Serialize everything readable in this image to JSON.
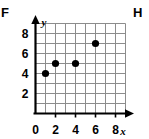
{
  "choices": {
    "left_label": "F",
    "right_label": "H"
  },
  "chart_data": {
    "type": "scatter",
    "title": "",
    "xlabel": "x",
    "ylabel": "y",
    "points": [
      {
        "x": 1,
        "y": 4
      },
      {
        "x": 2,
        "y": 5
      },
      {
        "x": 4,
        "y": 5
      },
      {
        "x": 6,
        "y": 7
      }
    ],
    "x": [
      1,
      2,
      4,
      6
    ],
    "values": [
      4,
      5,
      5,
      7
    ],
    "xlim": [
      0,
      9
    ],
    "ylim": [
      0,
      9
    ],
    "x_ticks": [
      0,
      2,
      4,
      6,
      8
    ],
    "y_ticks": [
      2,
      4,
      6,
      8
    ],
    "x_tick_labels": [
      "0",
      "2",
      "4",
      "6",
      "8"
    ],
    "y_tick_labels": [
      "2",
      "4",
      "6",
      "8"
    ],
    "grid": true,
    "grid_step": 1,
    "legend": "none",
    "marker": "filled-circle",
    "marker_color": "#000000",
    "grid_color": "#8c8c8c",
    "axis_color": "#000000"
  }
}
